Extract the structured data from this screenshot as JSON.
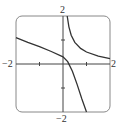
{
  "chart_data": {
    "type": "line",
    "title": "",
    "xlabel": "",
    "ylabel": "",
    "xlim": [
      -2,
      2
    ],
    "ylim": [
      -2,
      2
    ],
    "grid": false,
    "legend": null,
    "tick_labels": {
      "x_min": "−2",
      "x_max": "2",
      "y_min": "−2",
      "y_max": "2"
    },
    "ticks": {
      "x": [
        -1,
        1
      ],
      "y": [
        -1,
        1
      ]
    },
    "series": [
      {
        "name": "upper-branch",
        "x": [
          0.18,
          0.25,
          0.35,
          0.5,
          0.75,
          1.0,
          1.5,
          2.0
        ],
        "y": [
          2.0,
          1.55,
          1.2,
          0.9,
          0.65,
          0.5,
          0.33,
          0.22
        ]
      },
      {
        "name": "lower-branch",
        "x": [
          -2.0,
          -1.5,
          -1.0,
          -0.5,
          0.0,
          0.2,
          0.4,
          0.6,
          0.8,
          1.0
        ],
        "y": [
          1.1,
          0.9,
          0.72,
          0.52,
          0.3,
          0.1,
          -0.3,
          -0.85,
          -1.45,
          -2.0
        ]
      }
    ],
    "colors": {
      "curve": "#333333",
      "axes": "#444444",
      "frame": "#888888"
    }
  }
}
